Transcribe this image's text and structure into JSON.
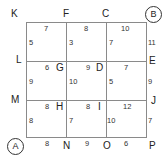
{
  "diagram": {
    "type": "grid-network",
    "grid": {
      "rows": 3,
      "cols": 3
    },
    "start": "A",
    "end": "B",
    "node_labels": {
      "K": "K",
      "F": "F",
      "C": "C",
      "B": "B",
      "L": "L",
      "G": "G",
      "D": "D",
      "E": "E",
      "M": "M",
      "H": "H",
      "I": "I",
      "J": "J",
      "A": "A",
      "N": "N",
      "O": "O",
      "P": "P"
    },
    "horizontal_weights": {
      "row0": [
        "7",
        "8",
        "10"
      ],
      "row1": [
        "6",
        "9",
        "7"
      ],
      "row2": [
        "8",
        "8",
        "12"
      ],
      "row3": [
        "8",
        "9",
        "6"
      ]
    },
    "vertical_weights": {
      "row0": [
        "5",
        "3",
        "7",
        "11"
      ],
      "row1": [
        "9",
        "10",
        "5",
        "9"
      ],
      "row2": [
        "8",
        "7",
        "10",
        "7"
      ]
    }
  }
}
